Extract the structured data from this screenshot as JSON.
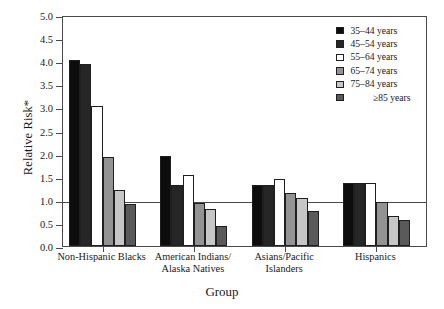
{
  "chart_data": {
    "type": "bar",
    "title": "",
    "subtitle": "",
    "xlabel": "Group",
    "ylabel": "Relative Risk*",
    "ylim": [
      0.0,
      5.0
    ],
    "ytick_step": 0.5,
    "ytick_labels": [
      "0.0",
      "0.5",
      "1.0",
      "1.5",
      "2.0",
      "2.5",
      "3.0",
      "3.5",
      "4.0",
      "4.5",
      "5.0"
    ],
    "grid": false,
    "legend_position": "top-right",
    "reference_line": {
      "value": 1.0,
      "label": ""
    },
    "categories": [
      "Non-Hispanic Blacks",
      "American Indians/\nAlaska Natives",
      "Asians/Pacific\nIslanders",
      "Hispanics"
    ],
    "category_lines": [
      [
        "Non-Hispanic Blacks"
      ],
      [
        "American Indians/",
        "Alaska Natives"
      ],
      [
        "Asians/Pacific",
        "Islanders"
      ],
      [
        "Hispanics"
      ]
    ],
    "series": [
      {
        "name": "35–44 years",
        "color": "#0d0d0d",
        "values": [
          4.03,
          1.94,
          1.33,
          1.36
        ]
      },
      {
        "name": "45–54 years",
        "color": "#262626",
        "values": [
          3.93,
          1.33,
          1.33,
          1.36
        ]
      },
      {
        "name": "55–64 years",
        "color": "#ffffff",
        "values": [
          3.02,
          1.53,
          1.45,
          1.36
        ]
      },
      {
        "name": "65–74 years",
        "color": "#939393",
        "values": [
          1.92,
          0.93,
          1.15,
          0.96
        ]
      },
      {
        "name": "75–84 years",
        "color": "#c6c6c6",
        "values": [
          1.21,
          0.81,
          1.04,
          0.66
        ]
      },
      {
        "name": "≥85 years",
        "color": "#5a5a5a",
        "values": [
          0.91,
          0.43,
          0.75,
          0.56
        ]
      }
    ]
  },
  "colors": {
    "axis": "#4a4a4a",
    "bar_outline": "#1f1f1f",
    "text": "#1a1a1a",
    "background": "#ffffff"
  }
}
